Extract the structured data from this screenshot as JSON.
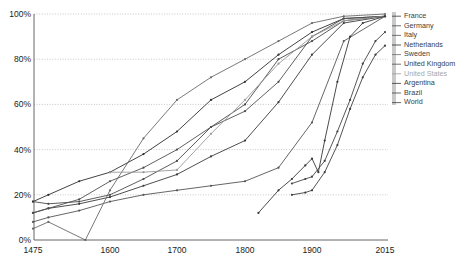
{
  "chart_data": {
    "type": "line",
    "title": "",
    "xlabel": "",
    "ylabel": "",
    "xlim": [
      1475,
      2015
    ],
    "ylim": [
      0,
      100
    ],
    "grid": true,
    "legend_position": "right",
    "xticks": [
      1475,
      1600,
      1700,
      1800,
      1900,
      2015
    ],
    "xtick_labels": [
      "1475",
      "1600",
      "1700",
      "1800",
      "1900",
      "2015"
    ],
    "yticks": [
      0,
      20,
      40,
      60,
      80,
      100
    ],
    "ytick_labels": [
      "0%",
      "20%",
      "40%",
      "60%",
      "80%",
      "100%"
    ],
    "series": [
      {
        "name": "France",
        "color": "#3a3a3a",
        "points": [
          [
            1475,
            12
          ],
          [
            1500,
            14
          ],
          [
            1550,
            16
          ],
          [
            1600,
            19
          ],
          [
            1650,
            24
          ],
          [
            1700,
            29
          ],
          [
            1750,
            37
          ],
          [
            1800,
            44
          ],
          [
            1850,
            61
          ],
          [
            1900,
            82
          ],
          [
            1950,
            96
          ],
          [
            2015,
            99
          ]
        ]
      },
      {
        "name": "Germany",
        "color": "#4a4a4a",
        "points": [
          [
            1475,
            17
          ],
          [
            1500,
            16
          ],
          [
            1550,
            17
          ],
          [
            1600,
            20
          ],
          [
            1650,
            27
          ],
          [
            1700,
            35
          ],
          [
            1750,
            50
          ],
          [
            1800,
            60
          ],
          [
            1850,
            80
          ],
          [
            1900,
            88
          ],
          [
            1950,
            97
          ],
          [
            2015,
            99
          ]
        ]
      },
      {
        "name": "Italy",
        "color": "#555555",
        "points": [
          [
            1475,
            8
          ],
          [
            1500,
            10
          ],
          [
            1550,
            13
          ],
          [
            1600,
            17
          ],
          [
            1650,
            20
          ],
          [
            1700,
            22
          ],
          [
            1750,
            24
          ],
          [
            1800,
            26
          ],
          [
            1850,
            32
          ],
          [
            1900,
            52
          ],
          [
            1950,
            88
          ],
          [
            2015,
            99
          ]
        ]
      },
      {
        "name": "Netherlands",
        "color": "#2e2e2e",
        "points": [
          [
            1475,
            17
          ],
          [
            1500,
            20
          ],
          [
            1550,
            26
          ],
          [
            1600,
            30
          ],
          [
            1650,
            38
          ],
          [
            1700,
            48
          ],
          [
            1750,
            62
          ],
          [
            1800,
            70
          ],
          [
            1850,
            82
          ],
          [
            1900,
            92
          ],
          [
            1950,
            98
          ],
          [
            2015,
            99
          ]
        ]
      },
      {
        "name": "Sweden",
        "color": "#6a6a6a",
        "points": [
          [
            1475,
            5
          ],
          [
            1500,
            8
          ],
          [
            1560,
            0
          ],
          [
            1600,
            22
          ],
          [
            1650,
            45
          ],
          [
            1700,
            62
          ],
          [
            1750,
            72
          ],
          [
            1800,
            80
          ],
          [
            1850,
            88
          ],
          [
            1900,
            96
          ],
          [
            1950,
            99
          ],
          [
            2015,
            100
          ]
        ]
      },
      {
        "name": "United Kingdom",
        "color": "#4f4f4f",
        "points": [
          [
            1475,
            12
          ],
          [
            1500,
            14
          ],
          [
            1550,
            18
          ],
          [
            1600,
            26
          ],
          [
            1650,
            32
          ],
          [
            1700,
            40
          ],
          [
            1750,
            50
          ],
          [
            1800,
            57
          ],
          [
            1850,
            70
          ],
          [
            1900,
            90
          ],
          [
            1950,
            98
          ],
          [
            2015,
            99
          ]
        ]
      },
      {
        "name": "United States",
        "color": "#9a9a9a",
        "points": [
          [
            1600,
            30
          ],
          [
            1650,
            30
          ],
          [
            1700,
            31
          ],
          [
            1750,
            47
          ],
          [
            1800,
            62
          ],
          [
            1850,
            78
          ],
          [
            1900,
            90
          ],
          [
            1950,
            97
          ],
          [
            2015,
            99
          ]
        ]
      },
      {
        "name": "Argentina",
        "color": "#383838",
        "points": [
          [
            1820,
            12
          ],
          [
            1850,
            22
          ],
          [
            1870,
            27
          ],
          [
            1890,
            33
          ],
          [
            1900,
            36
          ],
          [
            1910,
            30
          ],
          [
            1920,
            44
          ],
          [
            1940,
            70
          ],
          [
            1960,
            90
          ],
          [
            1980,
            96
          ],
          [
            2015,
            99
          ]
        ]
      },
      {
        "name": "Brazil",
        "color": "#444444",
        "points": [
          [
            1870,
            25
          ],
          [
            1890,
            27
          ],
          [
            1900,
            28
          ],
          [
            1920,
            35
          ],
          [
            1940,
            48
          ],
          [
            1960,
            62
          ],
          [
            1980,
            78
          ],
          [
            2000,
            88
          ],
          [
            2015,
            92
          ]
        ]
      },
      {
        "name": "World",
        "color": "#3f3f3f",
        "points": [
          [
            1870,
            20
          ],
          [
            1890,
            21
          ],
          [
            1900,
            22
          ],
          [
            1920,
            30
          ],
          [
            1940,
            42
          ],
          [
            1960,
            58
          ],
          [
            1980,
            72
          ],
          [
            2000,
            82
          ],
          [
            2015,
            86
          ]
        ]
      }
    ]
  },
  "legend": {
    "items": [
      {
        "label": "France"
      },
      {
        "label": "Germany"
      },
      {
        "label": "Italy"
      },
      {
        "label": "Netherlands"
      },
      {
        "label": "Sweden"
      },
      {
        "label": "United Kingdom"
      },
      {
        "label": "United States"
      },
      {
        "label": "Argentina"
      },
      {
        "label": "Brazil"
      },
      {
        "label": "World"
      }
    ],
    "bracket_color": "#9a9a9a"
  },
  "style": {
    "grid_color": "#b9b9b9",
    "axis_color": "#555555",
    "text_color": "#1a1a1a"
  }
}
